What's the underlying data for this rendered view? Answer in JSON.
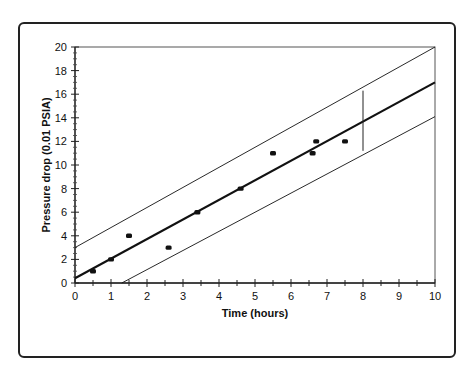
{
  "chart_data": {
    "type": "scatter",
    "title": "",
    "xlabel": "Time (hours)",
    "ylabel": "Pressure drop (0.01 PSIA)",
    "xlim": [
      0,
      10
    ],
    "ylim": [
      0,
      20
    ],
    "x_ticks": [
      0,
      1,
      2,
      3,
      4,
      5,
      6,
      7,
      8,
      9,
      10
    ],
    "y_ticks": [
      0,
      2,
      4,
      6,
      8,
      10,
      12,
      14,
      16,
      18,
      20
    ],
    "grid": false,
    "legend": null,
    "series": [
      {
        "name": "Observations",
        "kind": "scatter",
        "points": [
          {
            "x": 0.5,
            "y": 1
          },
          {
            "x": 1.0,
            "y": 2
          },
          {
            "x": 1.5,
            "y": 4
          },
          {
            "x": 2.6,
            "y": 3
          },
          {
            "x": 3.4,
            "y": 6
          },
          {
            "x": 4.6,
            "y": 8
          },
          {
            "x": 5.5,
            "y": 11
          },
          {
            "x": 6.6,
            "y": 11
          },
          {
            "x": 6.7,
            "y": 12
          },
          {
            "x": 7.5,
            "y": 12
          }
        ]
      },
      {
        "name": "Regression line",
        "kind": "line",
        "points": [
          {
            "x": 0,
            "y": 0.4
          },
          {
            "x": 10,
            "y": 17.0
          }
        ]
      },
      {
        "name": "Upper prediction bound",
        "kind": "line",
        "points": [
          {
            "x": 0,
            "y": 3.0
          },
          {
            "x": 10,
            "y": 20.0
          }
        ]
      },
      {
        "name": "Lower prediction bound",
        "kind": "line",
        "points": [
          {
            "x": 1.3,
            "y": 0
          },
          {
            "x": 10,
            "y": 14.1
          }
        ]
      }
    ],
    "annotations": [
      {
        "type": "vertical-segment",
        "x": 8,
        "y_from": 11.2,
        "y_to": 16.3,
        "description": "prediction interval at x = 8"
      }
    ]
  }
}
